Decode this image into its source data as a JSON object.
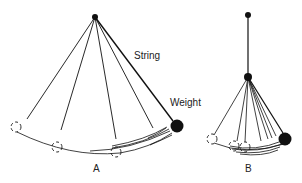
{
  "figure": {
    "pendulum_a": {
      "caption": "A",
      "string_label": "String",
      "weight_label": "Weight"
    },
    "pendulum_b": {
      "caption": "B"
    }
  },
  "colors": {
    "ink": "#111111",
    "background": "#ffffff"
  }
}
